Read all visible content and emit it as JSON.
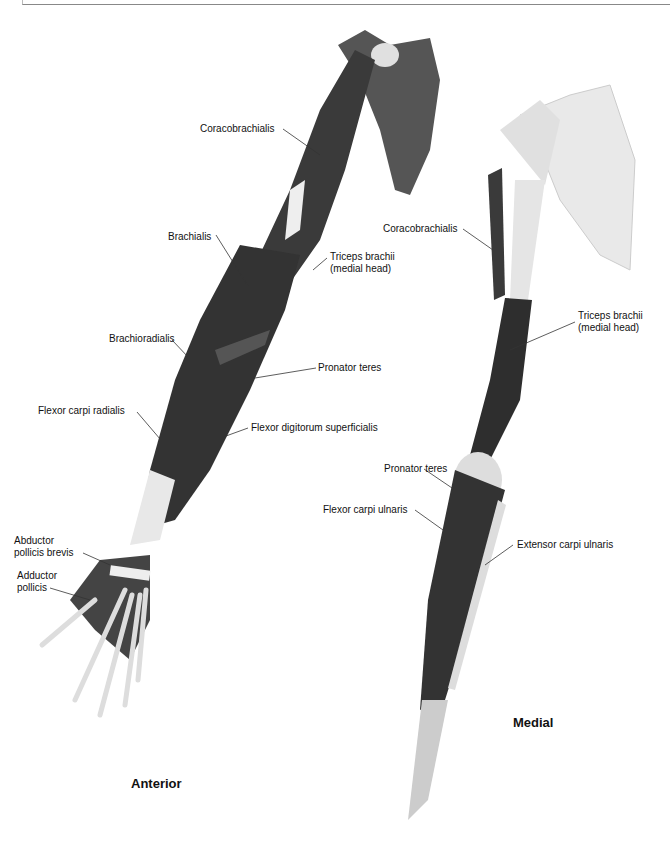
{
  "figure": {
    "views": [
      {
        "name": "Anterior",
        "labels": [
          {
            "id": "coracobrachialis",
            "text": "Coracobrachialis"
          },
          {
            "id": "brachialis",
            "text": "Brachialis"
          },
          {
            "id": "triceps",
            "line1": "Triceps brachii",
            "line2": "(medial head)"
          },
          {
            "id": "brachioradialis",
            "text": "Brachioradialis"
          },
          {
            "id": "pronator",
            "text": "Pronator teres"
          },
          {
            "id": "fcr",
            "text": "Flexor carpi radialis"
          },
          {
            "id": "fds",
            "text": "Flexor digitorum superficialis"
          },
          {
            "id": "apb",
            "line1": "Abductor",
            "line2": "pollicis brevis"
          },
          {
            "id": "ap",
            "line1": "Adductor",
            "line2": "pollicis"
          }
        ]
      },
      {
        "name": "Medial",
        "labels": [
          {
            "id": "coracobrachialis",
            "text": "Coracobrachialis"
          },
          {
            "id": "triceps",
            "line1": "Triceps brachii",
            "line2": "(medial head)"
          },
          {
            "id": "pronator",
            "text": "Pronator teres"
          },
          {
            "id": "fcu",
            "text": "Flexor carpi ulnaris"
          },
          {
            "id": "ecu",
            "text": "Extensor carpi ulnaris"
          }
        ]
      }
    ],
    "colors": {
      "muscle": "#3a3a3a",
      "bone": "#e6e6e6",
      "tendon": "#f2f2f2",
      "leader": "#333333"
    }
  }
}
